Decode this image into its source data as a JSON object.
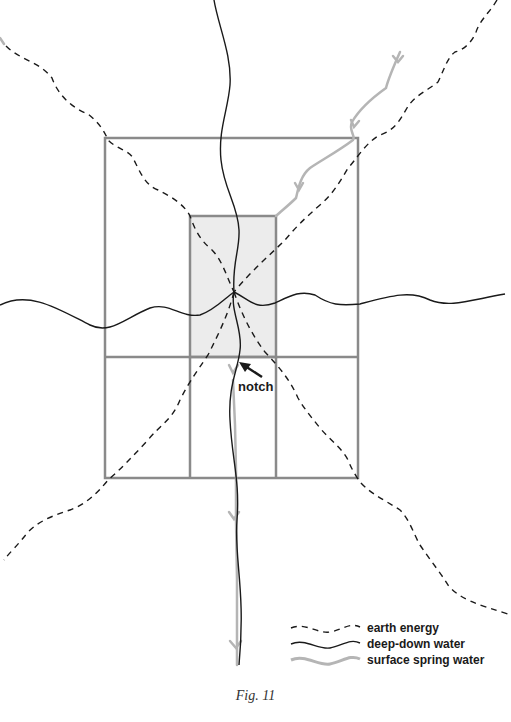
{
  "figure": {
    "caption": "Fig. 11",
    "annotation": {
      "label": "notch"
    },
    "legend": {
      "items": [
        {
          "label": "earth energy",
          "style": "dashed",
          "color": "#1a1a1a"
        },
        {
          "label": "deep-down water",
          "style": "solid",
          "color": "#1a1a1a"
        },
        {
          "label": "surface spring water",
          "style": "solid-thick",
          "color": "#b5b5b5"
        }
      ]
    },
    "colors": {
      "frame": "#8a8a8a",
      "shaded_area": "#ececec",
      "earth_energy": "#1a1a1a",
      "deep_water": "#1a1a1a",
      "surface_water": "#b5b5b5"
    }
  }
}
